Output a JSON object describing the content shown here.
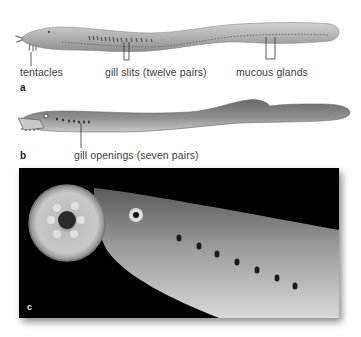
{
  "figure": {
    "panels": [
      {
        "id": "a",
        "letter": "a",
        "subject": "hagfish illustration",
        "labels": {
          "tentacles": "tentacles",
          "gill_slits": "gill slits (twelve pairs)",
          "mucous_glands": "mucous glands"
        }
      },
      {
        "id": "b",
        "letter": "b",
        "subject": "lamprey illustration",
        "labels": {
          "gill_openings": "gill openings (seven pairs)"
        }
      },
      {
        "id": "c",
        "letter": "c",
        "subject": "lamprey oral disc photograph"
      }
    ],
    "colors": {
      "background": "#ffffff",
      "hagfish_body": "#a9a9a9",
      "lamprey_body": "#8c8c8c",
      "photo_background": "#000000",
      "leader_lines": "#333333"
    }
  }
}
